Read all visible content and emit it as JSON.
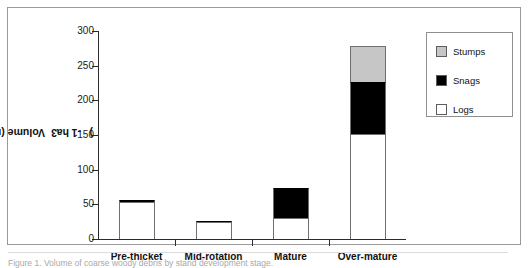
{
  "figure": {
    "caption_partial": "Figure 1. Volume of coarse woody debris by stand development stage."
  },
  "axes": {
    "y_title_main": "Volume (m",
    "y_title_sup1": "3",
    "y_title_mid": " ha",
    "y_title_sup2": "-1",
    "y_title_end": " )",
    "y_ticks": [
      0,
      50,
      100,
      150,
      200,
      250,
      300
    ],
    "y_tick_labels": [
      "0",
      "50",
      "100",
      "150",
      "200",
      "250",
      "300"
    ],
    "x_categories": [
      "Pre-thicket",
      "Mid-rotation",
      "Mature",
      "Over-mature"
    ]
  },
  "legend": {
    "position": "top-right",
    "items": [
      {
        "label": "Stumps",
        "color": "#c6c6c6"
      },
      {
        "label": "Snags",
        "color": "#000000"
      },
      {
        "label": "Logs",
        "color": "#ffffff"
      }
    ]
  },
  "chart_data": {
    "type": "bar",
    "stacked": true,
    "title": "",
    "xlabel": "",
    "ylabel": "Volume (m3 ha-1)",
    "ylim": [
      0,
      300
    ],
    "ytick_step": 50,
    "grid": false,
    "categories": [
      "Pre-thicket",
      "Mid-rotation",
      "Mature",
      "Over-mature"
    ],
    "series": [
      {
        "name": "Logs",
        "color": "#ffffff",
        "values": [
          53,
          24,
          30,
          152
        ]
      },
      {
        "name": "Snags",
        "color": "#000000",
        "values": [
          3,
          2,
          43,
          75
        ]
      },
      {
        "name": "Stumps",
        "color": "#c6c6c6",
        "values": [
          0,
          0,
          0,
          51
        ]
      }
    ],
    "totals": [
      56,
      26,
      73,
      278
    ]
  }
}
